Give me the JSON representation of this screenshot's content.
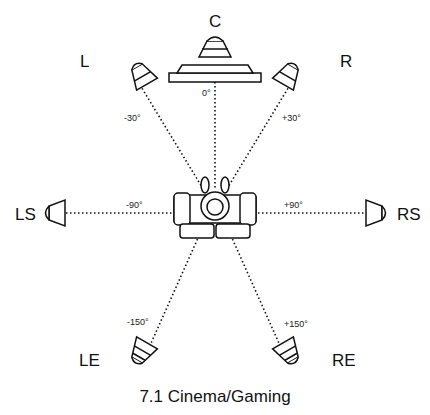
{
  "title": "7.1 Cinema/Gaming",
  "speakers": [
    {
      "id": "C",
      "label": "C",
      "angle_label": "0°"
    },
    {
      "id": "L",
      "label": "L",
      "angle_label": "-30°"
    },
    {
      "id": "R",
      "label": "R",
      "angle_label": "+30°"
    },
    {
      "id": "LS",
      "label": "LS",
      "angle_label": "-90°"
    },
    {
      "id": "RS",
      "label": "RS",
      "angle_label": "+90°"
    },
    {
      "id": "LE",
      "label": "LE",
      "angle_label": "-150°"
    },
    {
      "id": "RE",
      "label": "RE",
      "angle_label": "+150°"
    }
  ],
  "colors": {
    "line": "#111111",
    "background": "#ffffff"
  }
}
